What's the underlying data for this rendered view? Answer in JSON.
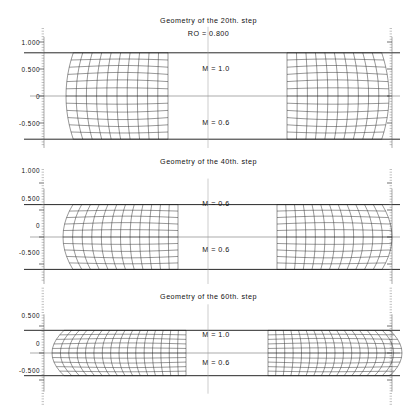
{
  "figure": {
    "caption_hidden": "",
    "panels": [
      {
        "id": "step-20",
        "title": "Geometry of the 20th. step",
        "subtitle": "RO = 0.800",
        "y_ticks": [
          "1.000",
          "0.500",
          "0",
          "-0.500"
        ],
        "y_tick_values": [
          1.0,
          0.5,
          0.0,
          -0.5
        ],
        "labels": [
          {
            "name": "m-upper",
            "text": "M = 1.0"
          },
          {
            "name": "m-lower",
            "text": "M = 0.6"
          }
        ],
        "billet_half_height": 0.8,
        "billet_half_width": 0.52,
        "bulge": 0.085,
        "radial_divisions": 11,
        "axial_divisions": 13
      },
      {
        "id": "step-40",
        "title": "Geometry of the 40th. step",
        "subtitle": "",
        "y_ticks": [
          "1.000",
          "0.500",
          "0",
          "-0.500"
        ],
        "y_tick_values": [
          1.0,
          0.5,
          0.0,
          -0.5
        ],
        "labels": [
          {
            "name": "m-upper",
            "text": "M = 0.6"
          },
          {
            "name": "m-lower",
            "text": "M = 0.6"
          }
        ],
        "billet_half_height": 0.6,
        "billet_half_width": 0.66,
        "bulge": 0.105,
        "radial_divisions": 13,
        "axial_divisions": 11
      },
      {
        "id": "step-60",
        "title": "Geometry of the 60th. step",
        "subtitle": "",
        "y_ticks": [
          "0.500",
          "0",
          "-0.500"
        ],
        "y_tick_values": [
          0.5,
          0.0,
          -0.5
        ],
        "labels": [
          {
            "name": "m-upper",
            "text": "M = 1.0"
          },
          {
            "name": "m-lower",
            "text": "M = 0.6"
          }
        ],
        "billet_half_height": 0.42,
        "billet_half_width": 0.92,
        "bulge": 0.11,
        "radial_divisions": 17,
        "axial_divisions": 11
      }
    ],
    "colors": {
      "mesh": "#1b1b1b",
      "boundary": "#111111",
      "axis": "#555555",
      "centerline": "#9a9a9a",
      "background": "#ffffff"
    }
  },
  "chart_data": {
    "type": "line",
    "subtitle": "RO = 0.800",
    "xlabel": "",
    "ylabel": "",
    "grid": false,
    "legend": "none",
    "panels": [
      {
        "title": "Geometry of the 20th. step",
        "ylim": [
          -1.0,
          1.2
        ],
        "yticks": [
          1.0,
          0.5,
          0.0,
          -0.5
        ],
        "ytick_labels": [
          "1.000",
          "0.500",
          "0",
          "-0.500"
        ],
        "annotations": [
          "RO = 0.800",
          "M = 1.0",
          "M = 0.6"
        ],
        "billet_top": 0.8,
        "billet_bottom": -0.8,
        "friction_upper": 1.0,
        "friction_lower": 0.6
      },
      {
        "title": "Geometry of the 40th. step",
        "ylim": [
          -1.0,
          1.1
        ],
        "yticks": [
          1.0,
          0.5,
          0.0,
          -0.5
        ],
        "ytick_labels": [
          "1.000",
          "0.500",
          "0",
          "-0.500"
        ],
        "annotations": [
          "M = 0.6",
          "M = 0.6"
        ],
        "billet_top": 0.6,
        "billet_bottom": -0.6,
        "friction_upper": 0.6,
        "friction_lower": 0.6
      },
      {
        "title": "Geometry of the 60th. step",
        "ylim": [
          -0.8,
          0.8
        ],
        "yticks": [
          0.5,
          0.0,
          -0.5
        ],
        "ytick_labels": [
          "0.500",
          "0",
          "-0.500"
        ],
        "annotations": [
          "M = 1.0",
          "M = 0.6"
        ],
        "billet_top": 0.42,
        "billet_bottom": -0.42,
        "friction_upper": 1.0,
        "friction_lower": 0.6
      }
    ]
  }
}
